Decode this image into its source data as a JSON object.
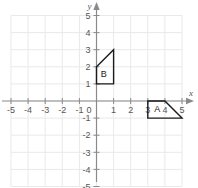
{
  "chart_data": {
    "type": "scatter",
    "title": "",
    "xlabel": "x",
    "ylabel": "y",
    "xlim": [
      -5,
      5
    ],
    "ylim": [
      -5,
      5
    ],
    "grid": true,
    "legend": "none",
    "x_ticks": [
      -5,
      -4,
      -3,
      -2,
      -1,
      0,
      1,
      2,
      3,
      4,
      5
    ],
    "y_ticks": [
      5,
      4,
      3,
      2,
      1,
      0,
      -1,
      -2,
      -3,
      -4,
      -5
    ],
    "x_tick_labels": [
      "-5",
      "-4",
      "-3",
      "-2",
      "-1",
      "0",
      "1",
      "2",
      "3",
      "4",
      "5"
    ],
    "y_tick_labels": [
      "5",
      "4",
      "3",
      "2",
      "1",
      "0",
      "-1",
      "-2",
      "-3",
      "-4",
      "-5"
    ],
    "origin_label": "0",
    "shapes": [
      {
        "name": "A",
        "label": "A",
        "label_position": [
          3.55,
          -0.48
        ],
        "vertices": [
          [
            3,
            0
          ],
          [
            4,
            0
          ],
          [
            5,
            -1
          ],
          [
            3,
            -1
          ]
        ],
        "closed": true,
        "stroke": "#1a1a1a",
        "fill": "none"
      },
      {
        "name": "B",
        "label": "B",
        "label_position": [
          0.42,
          1.58
        ],
        "vertices": [
          [
            0,
            1
          ],
          [
            0,
            2
          ],
          [
            1,
            3
          ],
          [
            1,
            1
          ]
        ],
        "closed": true,
        "stroke": "#1a1a1a",
        "fill": "none"
      }
    ],
    "colors": {
      "grid": "#e9e9e9",
      "axis": "#8a8a8a",
      "shape_stroke": "#1a1a1a",
      "tick_text": "#555555",
      "background": "#ffffff"
    }
  },
  "axis": {
    "x_name": "x",
    "y_name": "y"
  }
}
